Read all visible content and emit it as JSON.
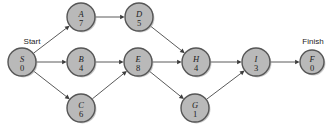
{
  "diagram": {
    "type": "activity-on-node-network",
    "labels": {
      "start": "Start",
      "finish": "Finish"
    },
    "nodes": [
      {
        "id": "S",
        "value": "0",
        "cx": 22,
        "cy": 62,
        "r": 14
      },
      {
        "id": "A",
        "value": "7",
        "cx": 81,
        "cy": 17,
        "r": 14
      },
      {
        "id": "D",
        "value": "5",
        "cx": 139,
        "cy": 17,
        "r": 14
      },
      {
        "id": "B",
        "value": "4",
        "cx": 81,
        "cy": 62,
        "r": 14
      },
      {
        "id": "E",
        "value": "8",
        "cx": 138,
        "cy": 62,
        "r": 14
      },
      {
        "id": "C",
        "value": "6",
        "cx": 81,
        "cy": 108,
        "r": 14
      },
      {
        "id": "H",
        "value": "4",
        "cx": 196,
        "cy": 62,
        "r": 14
      },
      {
        "id": "G",
        "value": "1",
        "cx": 195,
        "cy": 108,
        "r": 14
      },
      {
        "id": "I",
        "value": "3",
        "cx": 256,
        "cy": 62,
        "r": 14
      },
      {
        "id": "F",
        "value": "0",
        "cx": 312,
        "cy": 62,
        "r": 12
      }
    ],
    "edges": [
      {
        "from": "S",
        "to": "A"
      },
      {
        "from": "S",
        "to": "B"
      },
      {
        "from": "S",
        "to": "C"
      },
      {
        "from": "A",
        "to": "D"
      },
      {
        "from": "D",
        "to": "H"
      },
      {
        "from": "B",
        "to": "E"
      },
      {
        "from": "C",
        "to": "E"
      },
      {
        "from": "E",
        "to": "H"
      },
      {
        "from": "E",
        "to": "G"
      },
      {
        "from": "H",
        "to": "I"
      },
      {
        "from": "G",
        "to": "I"
      },
      {
        "from": "I",
        "to": "F"
      }
    ],
    "colors": {
      "node_fill": "#b9b9b9",
      "node_stroke": "#565656",
      "edge": "#5a5a5a",
      "text": "#1c1c1c",
      "background": "#ffffff"
    }
  }
}
